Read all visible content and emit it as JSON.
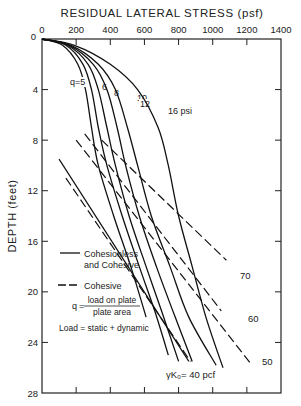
{
  "chart_data": {
    "type": "line",
    "title": "RESIDUAL LATERAL STRESS (psf)",
    "xlabel": "RESIDUAL LATERAL STRESS (psf)",
    "ylabel": "DEPTH (feet)",
    "xlim": [
      0,
      1400
    ],
    "ylim": [
      0,
      28
    ],
    "x_ticks": [
      "0",
      "200",
      "400",
      "600",
      "800",
      "1000",
      "1200",
      "1400"
    ],
    "x_tick_values": [
      0,
      200,
      400,
      600,
      800,
      1000,
      1200,
      1400
    ],
    "y_ticks": [
      "0",
      "4",
      "8",
      "12",
      "16",
      "20",
      "24",
      "28"
    ],
    "y_tick_values": [
      0,
      4,
      8,
      12,
      16,
      20,
      24,
      28
    ],
    "y_inverted": true,
    "grid": false,
    "series": [
      {
        "name": "q=5",
        "label": "q=5",
        "style": "solid",
        "points": [
          [
            0,
            0
          ],
          [
            120,
            0.5
          ],
          [
            210,
            2
          ],
          [
            255,
            4
          ],
          [
            290,
            7
          ],
          [
            330,
            10
          ],
          [
            420,
            14
          ],
          [
            520,
            18
          ],
          [
            610,
            22
          ]
        ]
      },
      {
        "name": "q=6",
        "label": "6",
        "style": "solid",
        "points": [
          [
            0,
            0
          ],
          [
            140,
            0.5
          ],
          [
            240,
            2
          ],
          [
            290,
            4
          ],
          [
            330,
            7
          ],
          [
            380,
            10
          ],
          [
            470,
            14
          ],
          [
            570,
            18
          ],
          [
            660,
            21.5
          ],
          [
            740,
            25
          ]
        ]
      },
      {
        "name": "q=8",
        "label": "8",
        "style": "solid",
        "points": [
          [
            0,
            0
          ],
          [
            150,
            0.5
          ],
          [
            270,
            2
          ],
          [
            330,
            4
          ],
          [
            380,
            7
          ],
          [
            430,
            10
          ],
          [
            510,
            14
          ],
          [
            610,
            18
          ],
          [
            700,
            21.5
          ],
          [
            800,
            25.5
          ]
        ]
      },
      {
        "name": "q=10",
        "label": "10",
        "style": "solid",
        "points": [
          [
            0,
            0
          ],
          [
            160,
            0.5
          ],
          [
            300,
            2
          ],
          [
            380,
            4
          ],
          [
            440,
            7
          ],
          [
            490,
            10
          ],
          [
            570,
            14
          ],
          [
            670,
            18
          ],
          [
            780,
            22
          ],
          [
            880,
            25.5
          ]
        ]
      },
      {
        "name": "q=12",
        "label": "12",
        "style": "solid",
        "points": [
          [
            0,
            0
          ],
          [
            170,
            0.5
          ],
          [
            330,
            2
          ],
          [
            430,
            4
          ],
          [
            500,
            7
          ],
          [
            560,
            10
          ],
          [
            640,
            14
          ],
          [
            750,
            18
          ],
          [
            860,
            22
          ],
          [
            1020,
            25.8
          ]
        ]
      },
      {
        "name": "q=16 psi",
        "label": "16 psi",
        "style": "solid",
        "points": [
          [
            0,
            0
          ],
          [
            190,
            0.5
          ],
          [
            400,
            2
          ],
          [
            560,
            4
          ],
          [
            680,
            7
          ],
          [
            740,
            10
          ],
          [
            800,
            14
          ],
          [
            880,
            18
          ],
          [
            960,
            22
          ],
          [
            1060,
            26
          ]
        ]
      }
    ],
    "reference_lines": [
      {
        "name": "γK0=40 pcf",
        "label": "γK₀= 40 pcf",
        "style": "solid",
        "points": [
          [
            100,
            9.5
          ],
          [
            860,
            25.5
          ]
        ]
      },
      {
        "name": "γK0=40 pcf (cohesive)",
        "label": "",
        "style": "dashed",
        "points": [
          [
            140,
            11
          ],
          [
            870,
            25.5
          ]
        ]
      },
      {
        "name": "γK0=50 pcf",
        "label": "50",
        "style": "dashed",
        "points": [
          [
            200,
            8
          ],
          [
            1230,
            25.8
          ]
        ]
      },
      {
        "name": "γK0=60 pcf",
        "label": "60",
        "style": "dashed",
        "points": [
          [
            250,
            7.5
          ],
          [
            1050,
            21.5
          ]
        ]
      },
      {
        "name": "γK0=70 pcf",
        "label": "70",
        "style": "dashed",
        "points": [
          [
            350,
            8
          ],
          [
            1080,
            17.5
          ]
        ]
      }
    ],
    "legend": {
      "placement": "bottom-left",
      "entries": [
        {
          "style": "solid",
          "label_line1": "Cohesionless",
          "label_line2": "and Cohesive"
        },
        {
          "style": "dashed",
          "label_line1": "Cohesive",
          "label_line2": ""
        }
      ]
    },
    "annotations": {
      "q_prefix": "q",
      "q_eq": "=",
      "q_numerator": "load on plate",
      "q_denominator": "plate area",
      "load_note": "Load = static + dynamic"
    }
  }
}
